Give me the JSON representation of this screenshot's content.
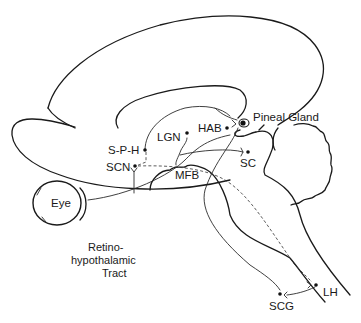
{
  "diagram": {
    "labels": {
      "pineal_gland": "Pineal Gland",
      "hab": "HAB",
      "lgn": "LGN",
      "sph": "S-P-H",
      "scn": "SCN",
      "sc": "SC",
      "mfb": "MFB",
      "eye": "Eye",
      "tract_line1": "Retino-",
      "tract_line2": "hypothalamic",
      "tract_line3": "Tract",
      "lh": "LH",
      "scg": "SCG"
    },
    "colors": {
      "stroke": "#1a1a1a",
      "background": "#ffffff"
    }
  }
}
